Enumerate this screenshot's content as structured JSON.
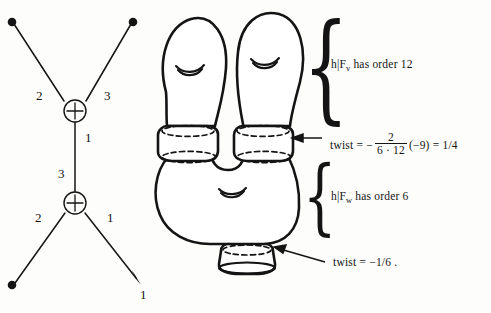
{
  "figure": {
    "background_color": "#fdfdfc",
    "ink_color": "#141414"
  },
  "graph": {
    "name": "weighted-plumbing-graph",
    "vertices": [
      {
        "id": "v-upper",
        "symbol": "+",
        "cx": 75,
        "cy": 111
      },
      {
        "id": "v-lower",
        "symbol": "+",
        "cx": 75,
        "cy": 203
      }
    ],
    "endpoints": [
      {
        "id": "ep-top-left",
        "style": "dot",
        "x": 12,
        "y": 22
      },
      {
        "id": "ep-top-right",
        "style": "dot",
        "x": 133,
        "y": 22
      },
      {
        "id": "ep-bottom-left",
        "style": "dot",
        "x": 12,
        "y": 285
      },
      {
        "id": "ep-bottom-right",
        "style": "arrow",
        "x": 140,
        "y": 283
      }
    ],
    "edge_labels": [
      {
        "id": "edge-label-upper-left",
        "text": "2",
        "x": 36,
        "y": 96
      },
      {
        "id": "edge-label-upper-right",
        "text": "3",
        "x": 104,
        "y": 96
      },
      {
        "id": "edge-label-middle-upper",
        "text": "1",
        "x": 86,
        "y": 137
      },
      {
        "id": "edge-label-middle-lower",
        "text": "3",
        "x": 60,
        "y": 174
      },
      {
        "id": "edge-label-lower-left",
        "text": "2",
        "x": 35,
        "y": 218
      },
      {
        "id": "edge-label-lower-right",
        "text": "1",
        "x": 107,
        "y": 218
      },
      {
        "id": "edge-label-arrow-tip",
        "text": "1",
        "x": 141,
        "y": 294
      }
    ]
  },
  "surface": {
    "name": "handlebody-surface",
    "handle_marks": [
      {
        "id": "handle-mark-left-lobe",
        "cx": 190,
        "cy": 70
      },
      {
        "id": "handle-mark-right-lobe",
        "cx": 265,
        "cy": 63
      },
      {
        "id": "handle-mark-base",
        "cx": 232,
        "cy": 192
      }
    ],
    "necks": [
      {
        "id": "neck-left",
        "label": "left neck band"
      },
      {
        "id": "neck-right",
        "label": "right neck band"
      },
      {
        "id": "neck-bottom",
        "label": "bottom boundary tube"
      }
    ]
  },
  "annotations": {
    "order_v": {
      "text_prefix": "h|F",
      "subscript": "v",
      "text_suffix": " has order  12",
      "full": "h|F_v has order 12"
    },
    "order_w": {
      "text_prefix": "h|F",
      "subscript": "w",
      "text_suffix": " has order  6",
      "full": "h|F_w has order 6"
    },
    "twist_upper": {
      "lead": "twist  =  −",
      "numerator": "2",
      "denominator": "6 · 12",
      "tail": "(−9)  =  1/4",
      "full": "twist = - 2/(6·12) (-9) = 1/4"
    },
    "twist_lower": {
      "full": "twist  =  −1/6 ."
    }
  }
}
